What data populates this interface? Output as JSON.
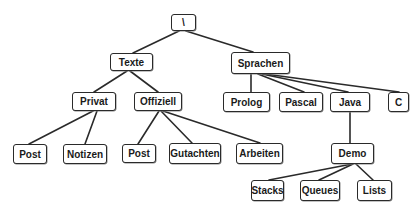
{
  "diagram": {
    "type": "tree",
    "title": "",
    "stroke_color": "#2a2a2a",
    "nodes": [
      {
        "id": "root",
        "label": "\\",
        "x": 171,
        "y": 14,
        "w": 25,
        "h": 17
      },
      {
        "id": "texte",
        "label": "Texte",
        "x": 110,
        "y": 53,
        "w": 43,
        "h": 18
      },
      {
        "id": "sprachen",
        "label": "Sprachen",
        "x": 231,
        "y": 52,
        "w": 59,
        "h": 22
      },
      {
        "id": "privat",
        "label": "Privat",
        "x": 72,
        "y": 92,
        "w": 44,
        "h": 19
      },
      {
        "id": "offiziell",
        "label": "Offiziell",
        "x": 134,
        "y": 92,
        "w": 48,
        "h": 19
      },
      {
        "id": "prolog",
        "label": "Prolog",
        "x": 223,
        "y": 92,
        "w": 47,
        "h": 20
      },
      {
        "id": "pascal",
        "label": "Pascal",
        "x": 279,
        "y": 92,
        "w": 44,
        "h": 20
      },
      {
        "id": "java",
        "label": "Java",
        "x": 330,
        "y": 92,
        "w": 40,
        "h": 20
      },
      {
        "id": "c",
        "label": "C",
        "x": 388,
        "y": 92,
        "w": 21,
        "h": 20
      },
      {
        "id": "post1",
        "label": "Post",
        "x": 13,
        "y": 144,
        "w": 34,
        "h": 20
      },
      {
        "id": "notizen",
        "label": "Notizen",
        "x": 63,
        "y": 144,
        "w": 44,
        "h": 20
      },
      {
        "id": "post2",
        "label": "Post",
        "x": 122,
        "y": 144,
        "w": 34,
        "h": 19
      },
      {
        "id": "gutachten",
        "label": "Gutachten",
        "x": 169,
        "y": 143,
        "w": 52,
        "h": 21
      },
      {
        "id": "arbeiten",
        "label": "Arbeiten",
        "x": 236,
        "y": 143,
        "w": 47,
        "h": 21
      },
      {
        "id": "demo",
        "label": "Demo",
        "x": 331,
        "y": 143,
        "w": 43,
        "h": 21
      },
      {
        "id": "stacks",
        "label": "Stacks",
        "x": 251,
        "y": 180,
        "w": 33,
        "h": 21
      },
      {
        "id": "queues",
        "label": "Queues",
        "x": 300,
        "y": 180,
        "w": 40,
        "h": 21
      },
      {
        "id": "lists",
        "label": "Lists",
        "x": 357,
        "y": 180,
        "w": 35,
        "h": 21
      }
    ],
    "edges": [
      {
        "from": "root",
        "to": "texte",
        "x1": 179,
        "y1": 31,
        "x2": 133,
        "y2": 53
      },
      {
        "from": "root",
        "to": "sprachen",
        "x1": 186,
        "y1": 31,
        "x2": 253,
        "y2": 52
      },
      {
        "from": "texte",
        "to": "privat",
        "x1": 127,
        "y1": 71,
        "x2": 94,
        "y2": 92
      },
      {
        "from": "texte",
        "to": "offiziell",
        "x1": 130,
        "y1": 71,
        "x2": 158,
        "y2": 92
      },
      {
        "from": "sprachen",
        "to": "prolog",
        "x1": 251,
        "y1": 74,
        "x2": 251,
        "y2": 92
      },
      {
        "from": "sprachen",
        "to": "pascal",
        "x1": 258,
        "y1": 74,
        "x2": 304,
        "y2": 92
      },
      {
        "from": "sprachen",
        "to": "java",
        "x1": 262,
        "y1": 74,
        "x2": 348,
        "y2": 92
      },
      {
        "from": "sprachen",
        "to": "c",
        "x1": 265,
        "y1": 74,
        "x2": 399,
        "y2": 92
      },
      {
        "from": "privat",
        "to": "post1",
        "x1": 93,
        "y1": 111,
        "x2": 29,
        "y2": 144
      },
      {
        "from": "privat",
        "to": "notizen",
        "x1": 97,
        "y1": 111,
        "x2": 85,
        "y2": 144
      },
      {
        "from": "offiziell",
        "to": "post2",
        "x1": 159,
        "y1": 111,
        "x2": 138,
        "y2": 144
      },
      {
        "from": "offiziell",
        "to": "gutachten",
        "x1": 161,
        "y1": 111,
        "x2": 192,
        "y2": 143
      },
      {
        "from": "offiziell",
        "to": "arbeiten",
        "x1": 163,
        "y1": 111,
        "x2": 260,
        "y2": 143
      },
      {
        "from": "java",
        "to": "demo",
        "x1": 350,
        "y1": 112,
        "x2": 350,
        "y2": 143
      },
      {
        "from": "demo",
        "to": "stacks",
        "x1": 352,
        "y1": 164,
        "x2": 269,
        "y2": 180
      },
      {
        "from": "demo",
        "to": "queues",
        "x1": 353,
        "y1": 164,
        "x2": 319,
        "y2": 180
      },
      {
        "from": "demo",
        "to": "lists",
        "x1": 356,
        "y1": 164,
        "x2": 373,
        "y2": 180
      }
    ]
  }
}
